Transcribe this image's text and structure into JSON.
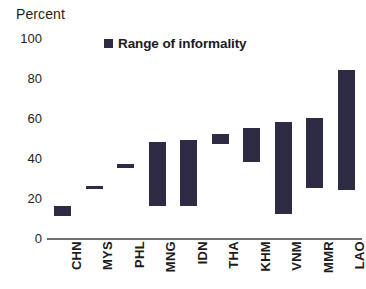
{
  "header": {
    "unit_label": "Percent"
  },
  "legend": {
    "items": [
      {
        "label": "Range of informality",
        "color": "#2e2b45",
        "marker": "square"
      }
    ],
    "position": "top-center"
  },
  "chart_data": {
    "type": "bar",
    "subtype": "floating-range-bar",
    "title": "",
    "subtitle": "",
    "xlabel": "",
    "ylabel": "Percent",
    "ylim": [
      0,
      100
    ],
    "yticks": [
      0,
      20,
      40,
      60,
      80,
      100
    ],
    "ytick_labels": [
      "0",
      "20",
      "40",
      "60",
      "80",
      "100"
    ],
    "grid": false,
    "categories": [
      "CHN",
      "MYS",
      "PHL",
      "MNG",
      "IDN",
      "THA",
      "KHM",
      "VNM",
      "MMR",
      "LAO"
    ],
    "series": [
      {
        "name": "Range of informality",
        "color": "#2e2b45",
        "low": [
          11,
          25,
          35,
          16,
          16,
          47,
          38,
          12,
          25,
          24
        ],
        "high": [
          16,
          26,
          37,
          48,
          49,
          52,
          55,
          58,
          60,
          84
        ]
      }
    ],
    "bars": [
      {
        "category": "CHN",
        "low": 11,
        "high": 16
      },
      {
        "category": "MYS",
        "low": 25,
        "high": 26
      },
      {
        "category": "PHL",
        "low": 35,
        "high": 37
      },
      {
        "category": "MNG",
        "low": 16,
        "high": 48
      },
      {
        "category": "IDN",
        "low": 16,
        "high": 49
      },
      {
        "category": "THA",
        "low": 47,
        "high": 52
      },
      {
        "category": "KHM",
        "low": 38,
        "high": 55
      },
      {
        "category": "VNM",
        "low": 12,
        "high": 58
      },
      {
        "category": "MMR",
        "low": 25,
        "high": 60
      },
      {
        "category": "LAO",
        "low": 24,
        "high": 84
      }
    ]
  },
  "colors": {
    "bar": "#2e2b45",
    "axis": "#6f6f77",
    "text": "#231f20",
    "background": "#ffffff"
  }
}
